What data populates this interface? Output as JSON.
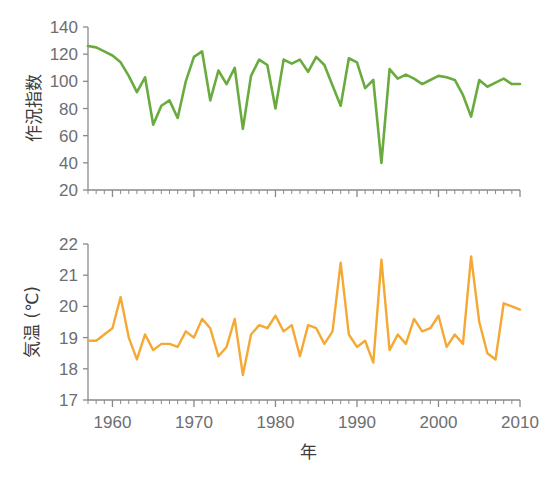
{
  "figure": {
    "background": "#ffffff",
    "width": 544,
    "height": 481,
    "xlabel": "年"
  },
  "chart_data": [
    {
      "type": "line",
      "id": "crop-index",
      "title": "",
      "xlabel": "年",
      "ylabel": "作況指数",
      "color": "#6aab3f",
      "xlim": [
        1957,
        2010
      ],
      "ylim": [
        20,
        140
      ],
      "ytick_labels": [
        "20",
        "40",
        "60",
        "80",
        "100",
        "120",
        "140"
      ],
      "yticks": [
        20,
        40,
        60,
        80,
        100,
        120,
        140
      ],
      "xtick_labels": [
        "1960",
        "1970",
        "1980",
        "1990",
        "2000",
        "2010"
      ],
      "xticks": [
        1960,
        1970,
        1980,
        1990,
        2000,
        2010
      ],
      "minor_xtick_interval": 1,
      "grid": false,
      "legend": false,
      "x": [
        1957,
        1958,
        1959,
        1960,
        1961,
        1962,
        1963,
        1964,
        1965,
        1966,
        1967,
        1968,
        1969,
        1970,
        1971,
        1972,
        1973,
        1974,
        1975,
        1976,
        1977,
        1978,
        1979,
        1980,
        1981,
        1982,
        1983,
        1984,
        1985,
        1986,
        1987,
        1988,
        1989,
        1990,
        1991,
        1992,
        1993,
        1994,
        1995,
        1996,
        1997,
        1998,
        1999,
        2000,
        2001,
        2002,
        2003,
        2004,
        2005,
        2006,
        2007,
        2008,
        2009,
        2010
      ],
      "values": [
        126,
        125,
        122,
        119,
        114,
        104,
        92,
        103,
        68,
        82,
        86,
        73,
        100,
        118,
        122,
        86,
        108,
        98,
        110,
        65,
        104,
        116,
        112,
        80,
        116,
        113,
        116,
        107,
        118,
        112,
        97,
        82,
        117,
        114,
        95,
        101,
        40,
        109,
        102,
        105,
        102,
        98,
        101,
        104,
        103,
        101,
        90,
        74,
        101,
        96,
        99,
        102,
        98,
        98
      ],
      "annotations": [
        {
          "x": 1993,
          "y": 40,
          "note": "記録的冷夏による大凶作"
        }
      ]
    },
    {
      "type": "line",
      "id": "temperature",
      "title": "",
      "xlabel": "年",
      "ylabel": "気温 (℃)",
      "color": "#f5a833",
      "xlim": [
        1957,
        2010
      ],
      "ylim": [
        17,
        22
      ],
      "ytick_labels": [
        "17",
        "18",
        "19",
        "20",
        "21",
        "22"
      ],
      "yticks": [
        17,
        18,
        19,
        20,
        21,
        22
      ],
      "xtick_labels": [
        "1960",
        "1970",
        "1980",
        "1990",
        "2000",
        "2010"
      ],
      "xticks": [
        1960,
        1970,
        1980,
        1990,
        2000,
        2010
      ],
      "minor_xtick_interval": 1,
      "grid": false,
      "legend": false,
      "x": [
        1957,
        1958,
        1959,
        1960,
        1961,
        1962,
        1963,
        1964,
        1965,
        1966,
        1967,
        1968,
        1969,
        1970,
        1971,
        1972,
        1973,
        1974,
        1975,
        1976,
        1977,
        1978,
        1979,
        1980,
        1981,
        1982,
        1983,
        1984,
        1985,
        1986,
        1987,
        1988,
        1989,
        1990,
        1991,
        1992,
        1993,
        1994,
        1995,
        1996,
        1997,
        1998,
        1999,
        2000,
        2001,
        2002,
        2003,
        2004,
        2005,
        2006,
        2007,
        2008,
        2009,
        2010
      ],
      "values": [
        18.9,
        18.9,
        19.1,
        19.3,
        20.3,
        19.0,
        18.3,
        19.1,
        18.6,
        18.8,
        18.8,
        18.7,
        19.2,
        19.0,
        19.6,
        19.3,
        18.4,
        18.7,
        19.6,
        17.8,
        19.1,
        19.4,
        19.3,
        19.7,
        19.2,
        19.4,
        18.4,
        19.4,
        19.3,
        18.8,
        19.2,
        21.4,
        19.1,
        18.7,
        18.9,
        18.2,
        21.5,
        18.6,
        19.1,
        18.8,
        19.6,
        19.2,
        19.3,
        19.7,
        18.7,
        19.1,
        18.8,
        21.6,
        19.5,
        18.5,
        18.3,
        20.1,
        20.0,
        19.9,
        19.5,
        18.4,
        20.0,
        19.9,
        19.6,
        22.0
      ]
    }
  ]
}
